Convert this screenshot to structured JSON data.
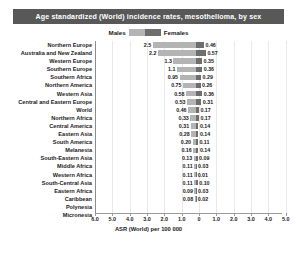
{
  "title": "Age standardized (World) incidence rates, mesothelioma, by sex",
  "legend": {
    "male_label": "Males",
    "female_label": "Females"
  },
  "axis": {
    "xlabel": "ASR (World) per 100 000",
    "ticks": [
      "6.0",
      "5.0",
      "4.0",
      "3.0",
      "2.0",
      "1.0",
      "0",
      "1.0",
      "2.0",
      "3.0",
      "4.0",
      "5.0",
      "6.0"
    ]
  },
  "colors": {
    "title_bar": "#585858",
    "title_text": "#ffffff",
    "male_bar": "#b4b4b4",
    "female_bar": "#6e6e6e",
    "axis_line": "#9a9a9a",
    "gridline": "#e9e9e9",
    "text": "#1a1a1a"
  },
  "chart_data": {
    "type": "bar",
    "orientation": "horizontal-diverging",
    "title": "Age standardized (World) incidence rates, mesothelioma, by sex",
    "xlabel": "ASR (World) per 100 000",
    "ylabel": "",
    "xlim": [
      -6.0,
      6.0
    ],
    "xticks": [
      6.0,
      5.0,
      4.0,
      3.0,
      2.0,
      1.0,
      0,
      1.0,
      2.0,
      3.0,
      4.0,
      5.0,
      6.0
    ],
    "grid": true,
    "legend_position": "top-center",
    "categories": [
      "Northern Europe",
      "Australia and New Zealand",
      "Western Europe",
      "Southern Europe",
      "Southern Africa",
      "Northern America",
      "Western Asia",
      "Central and Eastern Europe",
      "World",
      "Northern Africa",
      "Central America",
      "Eastern Asia",
      "South America",
      "Melanesia",
      "South-Eastern Asia",
      "Middle Africa",
      "Western Africa",
      "South-Central Asia",
      "Eastern Africa",
      "Caribbean",
      "Polynesia",
      "Micronesia"
    ],
    "series": [
      {
        "name": "Males",
        "side": "left",
        "values": [
          2.5,
          2.2,
          1.3,
          1.1,
          0.95,
          0.75,
          0.58,
          0.53,
          0.46,
          0.33,
          0.31,
          0.28,
          0.2,
          0.16,
          0.13,
          0.11,
          0.11,
          0.11,
          0.09,
          0.08,
          null,
          null
        ],
        "labels": [
          "2.5",
          "2.2",
          "1.3",
          "1.1",
          "0.95",
          "0.75",
          "0.58",
          "0.53",
          "0.46",
          "0.33",
          "0.31",
          "0.28",
          "0.20",
          "0.16",
          "0.13",
          "0.11",
          "0.11",
          "0.11",
          "0.09",
          "0.08",
          "",
          ""
        ]
      },
      {
        "name": "Females",
        "side": "right",
        "values": [
          0.46,
          0.57,
          0.35,
          0.36,
          0.29,
          0.26,
          0.36,
          0.31,
          0.17,
          0.17,
          0.14,
          0.14,
          0.11,
          0.14,
          0.09,
          0.03,
          0.01,
          0.1,
          0.03,
          0.02,
          null,
          null
        ],
        "labels": [
          "0.46",
          "0.57",
          "0.35",
          "0.36",
          "0.29",
          "0.26",
          "0.36",
          "0.31",
          "0.17",
          "0.17",
          "0.14",
          "0.14",
          "0.11",
          "0.14",
          "0.09",
          "0.03",
          "0.01",
          "0.10",
          "0.03",
          "0.02",
          "",
          ""
        ]
      }
    ]
  }
}
